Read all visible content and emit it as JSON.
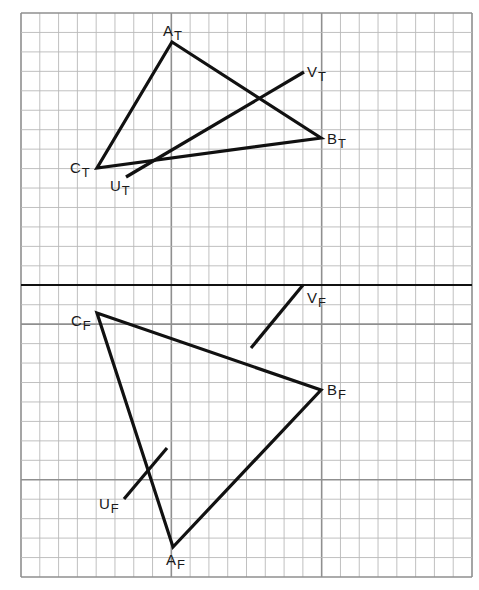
{
  "diagram": {
    "type": "orthographic-projection",
    "colors": {
      "background": "#ffffff",
      "grid_minor": "#b9b9b9",
      "grid_major": "#8f8f8f",
      "ink": "#111111"
    },
    "grid": {
      "x0": 21,
      "x1": 472,
      "y0": 13,
      "y1": 577,
      "cols": 24,
      "rows": 29,
      "major_cols": [
        0,
        8,
        16,
        24
      ],
      "major_rows": [
        16,
        24
      ]
    },
    "fold_line": {
      "x1": 21,
      "y1": 285,
      "x2": 472,
      "y2": 285
    },
    "top_view": {
      "triangle": {
        "A": {
          "x": 172,
          "y": 42
        },
        "B": {
          "x": 321,
          "y": 138
        },
        "C": {
          "x": 97,
          "y": 168
        }
      },
      "line_UV": {
        "start": {
          "x": 126,
          "y": 177
        },
        "end": {
          "x": 304,
          "y": 72
        },
        "hidden_gap": false
      },
      "labels": [
        {
          "id": "A_T",
          "main": "A",
          "sub": "T",
          "x": 163,
          "y": 36
        },
        {
          "id": "B_T",
          "main": "B",
          "sub": "T",
          "x": 327,
          "y": 144
        },
        {
          "id": "C_T",
          "main": "C",
          "sub": "T",
          "x": 70,
          "y": 173
        },
        {
          "id": "U_T",
          "main": "U",
          "sub": "T",
          "x": 110,
          "y": 191
        },
        {
          "id": "V_T",
          "main": "V",
          "sub": "T",
          "x": 307,
          "y": 77
        }
      ]
    },
    "front_view": {
      "triangle": {
        "A": {
          "x": 173,
          "y": 547
        },
        "B": {
          "x": 321,
          "y": 390
        },
        "C": {
          "x": 97,
          "y": 313
        }
      },
      "line_UV": {
        "start": {
          "x": 124,
          "y": 499
        },
        "end": {
          "x": 167,
          "y": 448
        }
      },
      "line_V": {
        "start": {
          "x": 251,
          "y": 348
        },
        "end": {
          "x": 303,
          "y": 285
        }
      },
      "labels": [
        {
          "id": "A_F",
          "main": "A",
          "sub": "F",
          "x": 166,
          "y": 565
        },
        {
          "id": "B_F",
          "main": "B",
          "sub": "F",
          "x": 327,
          "y": 395
        },
        {
          "id": "C_F",
          "main": "C",
          "sub": "F",
          "x": 71,
          "y": 326
        },
        {
          "id": "U_F",
          "main": "U",
          "sub": "F",
          "x": 99,
          "y": 509
        },
        {
          "id": "V_F",
          "main": "V",
          "sub": "F",
          "x": 307,
          "y": 303
        }
      ]
    }
  }
}
